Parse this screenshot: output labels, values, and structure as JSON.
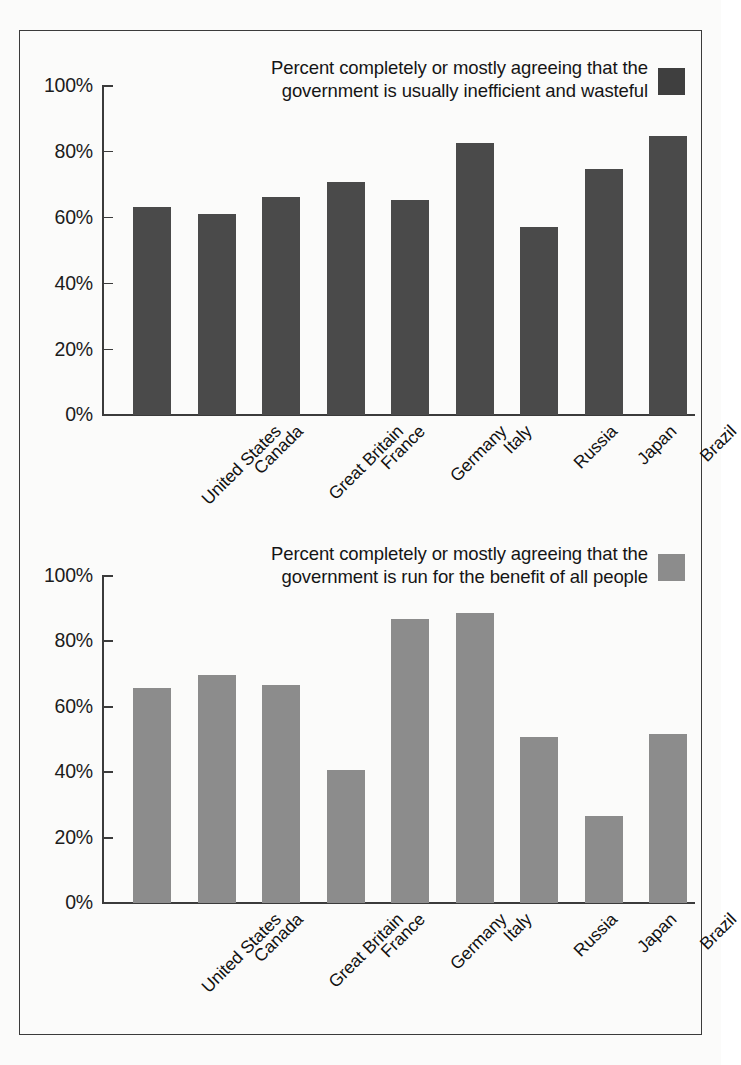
{
  "figure": {
    "background": "#fbfbfa",
    "border_color": "#3b3b3b"
  },
  "chart_data": [
    {
      "type": "bar",
      "id": "inefficient-wasteful",
      "title": "Percent completely or mostly agreeing that the\ngovernment is usually inefficient and wasteful",
      "xlabel": "",
      "ylabel": "",
      "ylim": [
        0,
        100
      ],
      "grid": false,
      "legend_position": "top-right",
      "bar_color": "#4a4a4a",
      "yticks": [
        0,
        20,
        40,
        60,
        80,
        100
      ],
      "ytick_labels": [
        "0%",
        "20%",
        "40%",
        "60%",
        "80%",
        "100%"
      ],
      "categories": [
        "United States",
        "Canada",
        "Great Britain",
        "France",
        "Germany",
        "Italy",
        "Russia",
        "Japan",
        "Brazil"
      ],
      "values": [
        63,
        61,
        66,
        70.5,
        65,
        82.5,
        57,
        74.5,
        84.5
      ]
    },
    {
      "type": "bar",
      "id": "benefit-of-all-people",
      "title": "Percent completely or mostly agreeing that the\ngovernment is run for the benefit of all people",
      "xlabel": "",
      "ylabel": "",
      "ylim": [
        0,
        100
      ],
      "grid": false,
      "legend_position": "top-right",
      "bar_color": "#8c8c8c",
      "yticks": [
        0,
        20,
        40,
        60,
        80,
        100
      ],
      "ytick_labels": [
        "0%",
        "20%",
        "40%",
        "60%",
        "80%",
        "100%"
      ],
      "categories": [
        "United States",
        "Canada",
        "Great Britain",
        "France",
        "Germany",
        "Italy",
        "Russia",
        "Japan",
        "Brazil"
      ],
      "values": [
        65.5,
        69.5,
        66.5,
        40.5,
        86.5,
        88.5,
        50.5,
        26.5,
        51.5
      ]
    }
  ]
}
